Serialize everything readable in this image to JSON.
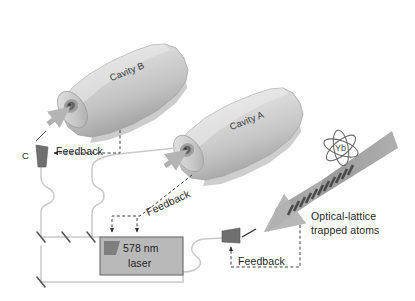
{
  "figure": {
    "domain_kind": "optics-schematic",
    "background": "#ffffff"
  },
  "cavities": [
    {
      "id": "cavity-b",
      "label": "Cavity B",
      "body_color": "#d9d9d9",
      "shade_color": "#a9a9a9"
    },
    {
      "id": "cavity-a",
      "label": "Cavity A",
      "body_color": "#dcdcdc",
      "shade_color": "#aeaeae"
    }
  ],
  "laser": {
    "line1": "578 nm",
    "line2": "laser",
    "box_color": "#b9b9b9",
    "border_color": "#6b6b6b",
    "chip_color": "#7f7f7f"
  },
  "modulator": {
    "label": "C",
    "color": "#6f6f6f"
  },
  "feedback": [
    {
      "id": "feedback-cavity-b",
      "label": "Feedback"
    },
    {
      "id": "feedback-cavity-a",
      "label": "Feedback"
    },
    {
      "id": "feedback-lattice",
      "label": "Feedback"
    }
  ],
  "atoms": {
    "species": "Yb",
    "caption_line1": "Optical-lattice",
    "caption_line2": "trapped atoms",
    "beam_color": "#9a9a9a",
    "fringe_color": "#4a4a4a"
  },
  "fiber": {
    "color": "#c9c9c9",
    "coupler_color": "#555555"
  },
  "colors": {
    "dashed_line": "#3d3d3d",
    "arrow": "#b0b0b0",
    "text": "#262626"
  }
}
